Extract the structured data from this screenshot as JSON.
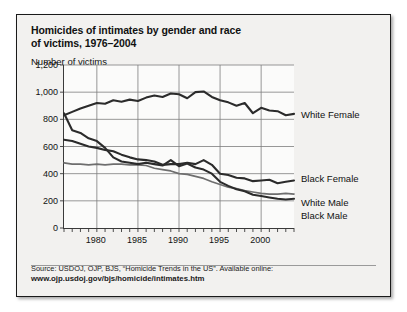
{
  "figure": {
    "title_line1": "Homicides of intimates by gender and race",
    "title_line2": "of victims, 1976–2004",
    "axis_title": "Number of victims",
    "source_text": "Source: USDOJ, OJP, BJS, “Homicide Trends in the US”. Available online:",
    "source_url": "www.ojp.usdoj.gov/bjs/homicide/intimates.htm",
    "frame_color": "#1a1a1a",
    "background_color": "#f2f1ef",
    "plot_background_color": "#fbfbfa"
  },
  "chart_data": {
    "type": "line",
    "title": "Homicides of intimates by gender and race of victims, 1976–2004",
    "xlabel": "",
    "ylabel": "Number of victims",
    "xlim": [
      1976,
      2004
    ],
    "ylim": [
      0,
      1200
    ],
    "yticks": [
      "0",
      "200",
      "400",
      "600",
      "800",
      "1,000",
      "1,200"
    ],
    "ytick_values": [
      0,
      200,
      400,
      600,
      800,
      1000,
      1200
    ],
    "xticks": [
      "1980",
      "1985",
      "1990",
      "1995",
      "2000"
    ],
    "xtick_values": [
      1980,
      1985,
      1990,
      1995,
      2000
    ],
    "grid": "horizontal-and-vertical",
    "legend_position": "right-inline-labels",
    "x": [
      1976,
      1977,
      1978,
      1979,
      1980,
      1981,
      1982,
      1983,
      1984,
      1985,
      1986,
      1987,
      1988,
      1989,
      1990,
      1991,
      1992,
      1993,
      1994,
      1995,
      1996,
      1997,
      1998,
      1999,
      2000,
      2001,
      2002,
      2003,
      2004
    ],
    "series": [
      {
        "name": "White Female",
        "color": "#2b2b2b",
        "style": "solid-thick",
        "values": [
          830,
          855,
          880,
          900,
          920,
          915,
          940,
          930,
          945,
          935,
          960,
          975,
          965,
          990,
          985,
          955,
          1000,
          1005,
          965,
          940,
          925,
          900,
          920,
          845,
          885,
          865,
          860,
          830,
          840
        ]
      },
      {
        "name": "Black Female",
        "color": "#2b2b2b",
        "style": "solid-thick",
        "values": [
          650,
          640,
          620,
          600,
          590,
          575,
          565,
          540,
          520,
          505,
          500,
          490,
          465,
          470,
          470,
          480,
          470,
          500,
          465,
          400,
          390,
          370,
          365,
          345,
          350,
          355,
          330,
          340,
          350
        ]
      },
      {
        "name": "White Male",
        "color": "#6e6e6e",
        "style": "solid-medium",
        "values": [
          480,
          470,
          470,
          465,
          470,
          465,
          470,
          470,
          465,
          465,
          460,
          440,
          430,
          420,
          400,
          395,
          380,
          365,
          340,
          320,
          300,
          290,
          275,
          265,
          255,
          250,
          250,
          255,
          250
        ]
      },
      {
        "name": "Black Male",
        "color": "#2b2b2b",
        "style": "solid-thick",
        "values": [
          845,
          720,
          700,
          660,
          640,
          590,
          520,
          490,
          480,
          470,
          480,
          470,
          460,
          500,
          455,
          475,
          445,
          430,
          400,
          340,
          310,
          285,
          270,
          245,
          235,
          225,
          215,
          210,
          215
        ]
      }
    ]
  },
  "series_labels": [
    {
      "name": "White Female",
      "value_at_end": 840
    },
    {
      "name": "Black Female",
      "value_at_end": 350
    },
    {
      "name": "White Male",
      "value_at_end": 250
    },
    {
      "name": "Black Male",
      "value_at_end": 215
    }
  ]
}
